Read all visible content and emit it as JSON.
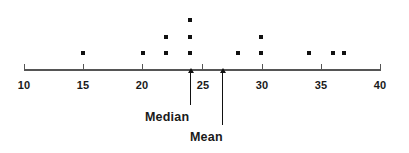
{
  "chart_data": {
    "type": "scatter",
    "plot_style": "dot-plot",
    "title": "",
    "subtitle": "",
    "xlabel": "",
    "ylabel": "",
    "xlim": [
      10,
      40
    ],
    "grid": false,
    "legend": null,
    "axis_ticks": [
      10,
      15,
      20,
      25,
      30,
      35,
      40
    ],
    "tick_labels": [
      "10",
      "15",
      "20",
      "25",
      "30",
      "35",
      "40"
    ],
    "values": [
      15,
      20,
      22,
      22,
      24,
      24,
      24,
      28,
      30,
      30,
      34,
      36,
      37
    ],
    "stacks": [
      {
        "value": 15,
        "count": 1
      },
      {
        "value": 20,
        "count": 1
      },
      {
        "value": 22,
        "count": 2
      },
      {
        "value": 24,
        "count": 3
      },
      {
        "value": 28,
        "count": 1
      },
      {
        "value": 30,
        "count": 2
      },
      {
        "value": 34,
        "count": 1
      },
      {
        "value": 36,
        "count": 1
      },
      {
        "value": 37,
        "count": 1
      }
    ],
    "annotations": [
      {
        "id": "median",
        "label": "Median",
        "value": 24,
        "arrow": "up"
      },
      {
        "id": "mean",
        "label": "Mean",
        "value": 26.7,
        "arrow": "up"
      }
    ],
    "colors": {
      "dot": "#111111",
      "axis": "#555555",
      "text": "#1a1a1a",
      "background": "#ffffff"
    }
  }
}
